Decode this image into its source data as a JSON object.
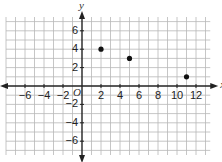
{
  "chart_data": {
    "type": "scatter",
    "title": "",
    "xlabel": "x",
    "ylabel": "y",
    "origin_label": "O",
    "xlim": [
      -8,
      13.5
    ],
    "ylim": [
      -7.5,
      7.5
    ],
    "grid": true,
    "legend": null,
    "x_ticks": [
      -6,
      -4,
      -2,
      2,
      4,
      6,
      8,
      10,
      12
    ],
    "y_ticks": [
      6,
      4,
      2,
      -2,
      -4,
      -6
    ],
    "x_tick_labels": [
      "−6",
      "−4",
      "−2",
      "2",
      "4",
      "6",
      "8",
      "10",
      "12"
    ],
    "y_tick_labels": [
      "6",
      "4",
      "2",
      "−2",
      "−4",
      "−6"
    ],
    "points": [
      {
        "x": 2,
        "y": 4
      },
      {
        "x": 5,
        "y": 3
      },
      {
        "x": 11,
        "y": 1
      }
    ]
  },
  "colors": {
    "grid": "#b8b8b8",
    "axis": "#222222",
    "point": "#111111"
  }
}
